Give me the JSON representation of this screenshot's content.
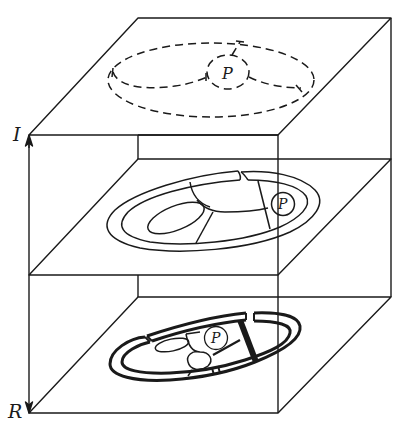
{
  "diagram": {
    "type": "layered-box-diagram",
    "axis": {
      "top_label": "I",
      "bottom_label": "R",
      "direction": "bidirectional"
    },
    "layers": [
      {
        "position": "top",
        "style": "dashed",
        "center_label": "P"
      },
      {
        "position": "middle",
        "style": "thin-solid",
        "center_label": "P"
      },
      {
        "position": "bottom",
        "style": "thick-solid",
        "center_label": "P"
      }
    ],
    "colors": {
      "stroke": "#1a1a1a",
      "background": "#ffffff"
    }
  }
}
